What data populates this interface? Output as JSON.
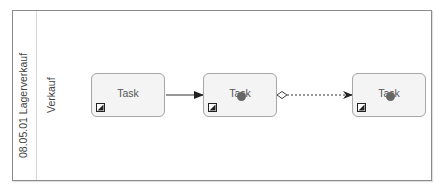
{
  "pool": {
    "label": "08.05.01 Lagerverkauf",
    "lane_label": "Verkauf"
  },
  "tasks": [
    {
      "label": "Task",
      "marker": "manual-task-icon",
      "has_dot": false
    },
    {
      "label": "Task",
      "marker": "manual-task-icon",
      "has_dot": true
    },
    {
      "label": "Task",
      "marker": "manual-task-icon",
      "has_dot": true
    }
  ],
  "edges": [
    {
      "from": 0,
      "to": 1,
      "type": "sequence-flow",
      "style": "solid"
    },
    {
      "from": 1,
      "to": 2,
      "type": "association-flow",
      "style": "dashed",
      "source_marker": "diamond"
    }
  ],
  "colors": {
    "border": "#8a8a8a",
    "task_fill": "#f4f4f4",
    "task_stroke": "#a8a8a8",
    "edge": "#333333",
    "dot": "#666666"
  }
}
